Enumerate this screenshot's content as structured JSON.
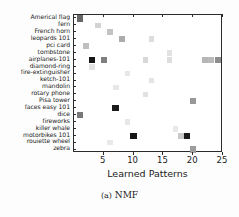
{
  "caption": "(a) NMF",
  "caption_index": "(a)",
  "caption_label": "NMF",
  "colors": {
    "axis": "#2b2b2b",
    "text": "#1a1a1a",
    "background": "#ffffff",
    "marker_dark": "#111111",
    "marker_mid": "#9a9a9a",
    "marker_light": "#d8d8d8",
    "marker_faint": "#ededed"
  },
  "chart_data": {
    "type": "heatmap",
    "title": "",
    "xlabel": "Learned Patterns",
    "ylabel": "",
    "xlim": [
      0,
      25
    ],
    "ylim": [
      0,
      20
    ],
    "grid": false,
    "legend": "none",
    "xticks": [
      5,
      10,
      15,
      20,
      25
    ],
    "xticklabels": [
      "5",
      "10",
      "15",
      "20",
      "25"
    ],
    "categories": [
      "Americal flag",
      "fern",
      "French horn",
      "leopards 101",
      "pci card",
      "tombstone",
      "airplanes-101",
      "diamond-ring",
      "fire-extinguisher",
      "ketch-101",
      "mandolin",
      "rotary phone",
      "Pisa tower",
      "faces easy 101",
      "dice",
      "fireworks",
      "killer whale",
      "motorbikes 101",
      "rouiette wheel",
      "zebra"
    ],
    "value_range": [
      0,
      1
    ],
    "points": [
      {
        "x": 1,
        "row": 0,
        "category": "Americal flag",
        "value": 0.62
      },
      {
        "x": 4,
        "row": 1,
        "category": "fern",
        "value": 0.18
      },
      {
        "x": 6,
        "row": 2,
        "category": "French horn",
        "value": 0.24
      },
      {
        "x": 8,
        "row": 3,
        "category": "leopards 101",
        "value": 0.34
      },
      {
        "x": 13,
        "row": 3,
        "category": "leopards 101",
        "value": 0.14
      },
      {
        "x": 2,
        "row": 4,
        "category": "pci card",
        "value": 0.26
      },
      {
        "x": 16,
        "row": 5,
        "category": "tombstone",
        "value": 0.12
      },
      {
        "x": 3,
        "row": 6,
        "category": "airplanes-101",
        "value": 0.95
      },
      {
        "x": 5,
        "row": 6,
        "category": "airplanes-101",
        "value": 0.52
      },
      {
        "x": 12,
        "row": 6,
        "category": "airplanes-101",
        "value": 0.16
      },
      {
        "x": 16,
        "row": 6,
        "category": "airplanes-101",
        "value": 0.14
      },
      {
        "x": 22,
        "row": 6,
        "category": "airplanes-101",
        "value": 0.3
      },
      {
        "x": 23,
        "row": 6,
        "category": "airplanes-101",
        "value": 0.28
      },
      {
        "x": 25,
        "row": 6,
        "category": "airplanes-101",
        "value": 0.46
      },
      {
        "x": 3,
        "row": 7,
        "category": "diamond-ring",
        "value": 0.12
      },
      {
        "x": 9,
        "row": 8,
        "category": "fire-extinguisher",
        "value": 0.1
      },
      {
        "x": 13,
        "row": 9,
        "category": "ketch-101",
        "value": 0.11
      },
      {
        "x": 7,
        "row": 10,
        "category": "mandolin",
        "value": 0.1
      },
      {
        "x": 12,
        "row": 11,
        "category": "rotary phone",
        "value": 0.12
      },
      {
        "x": 20,
        "row": 12,
        "category": "Pisa tower",
        "value": 0.42
      },
      {
        "x": 7,
        "row": 13,
        "category": "faces easy 101",
        "value": 0.93
      },
      {
        "x": 1,
        "row": 14,
        "category": "dice",
        "value": 0.55
      },
      {
        "x": 9,
        "row": 15,
        "category": "fireworks",
        "value": 0.1
      },
      {
        "x": 17,
        "row": 16,
        "category": "killer whale",
        "value": 0.09
      },
      {
        "x": 10,
        "row": 17,
        "category": "motorbikes 101",
        "value": 0.96
      },
      {
        "x": 19,
        "row": 17,
        "category": "motorbikes 101",
        "value": 0.93
      },
      {
        "x": 18,
        "row": 17,
        "category": "motorbikes 101",
        "value": 0.22
      },
      {
        "x": 6,
        "row": 18,
        "category": "rouiette wheel",
        "value": 0.09
      },
      {
        "x": 20,
        "row": 19,
        "category": "zebra",
        "value": 0.4
      }
    ]
  }
}
